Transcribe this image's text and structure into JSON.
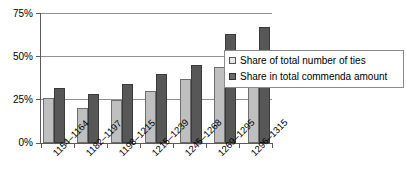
{
  "chart_data": {
    "type": "bar",
    "title": "",
    "subtitle": "",
    "xlabel": "",
    "ylabel": "",
    "ylim": [
      0,
      75
    ],
    "ytick_labels": [
      "0%",
      "25%",
      "50%",
      "75%"
    ],
    "ytick_values": [
      0,
      25,
      50,
      75
    ],
    "grid": true,
    "grid_axis": "y",
    "legend_position": "right",
    "categories": [
      "1154–1164",
      "1182–1197",
      "1198–1215",
      "1215–1239",
      "1245–1268",
      "1269–1295",
      "1296–1315"
    ],
    "series": [
      {
        "name": "Share of total number of ties",
        "color": "#bfbfbf",
        "values": [
          26,
          20,
          25,
          30,
          37,
          44,
          45
        ]
      },
      {
        "name": "Share in total commenda amount",
        "color": "#575757",
        "values": [
          32,
          28,
          34,
          40,
          45,
          63,
          67
        ]
      }
    ]
  },
  "legend": {
    "items": [
      {
        "label": "Share of total number of ties",
        "swatch": "light-gray-swatch"
      },
      {
        "label": "Share in total commenda amount",
        "swatch": "dark-gray-swatch"
      }
    ]
  }
}
